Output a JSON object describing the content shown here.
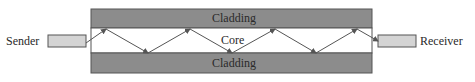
{
  "diagram": {
    "sender_label": "Sender",
    "receiver_label": "Receiver",
    "top_cladding_label": "Cladding",
    "core_label": "Core",
    "bottom_cladding_label": "Cladding"
  },
  "colors": {
    "cladding": "#8c8c8c",
    "core": "#ffffff",
    "box_fill": "#d4d4d4",
    "stroke": "#555555"
  }
}
